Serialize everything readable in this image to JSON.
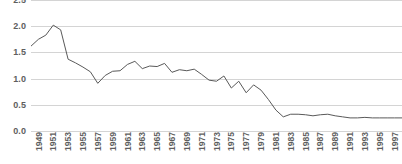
{
  "chart_data": {
    "type": "line",
    "title": "",
    "subtitle": "",
    "xlabel": "",
    "ylabel": "",
    "ylim": [
      0.0,
      2.5
    ],
    "ytick_labels": [
      "2.5",
      "2.0",
      "1.5",
      "1.0",
      "0.5",
      "0.0"
    ],
    "ytick_values": [
      2.5,
      2.0,
      1.5,
      1.0,
      0.5,
      0.0
    ],
    "grid": true,
    "grid_axis": "y",
    "legend": false,
    "legend_position": "none",
    "line_color": "#595959",
    "grid_color": "#d4d4d4",
    "text_color": "#5e5e5e",
    "background_color": "#ffffff",
    "xtick_labels": [
      "1949",
      "1951",
      "1953",
      "1955",
      "1957",
      "1959",
      "1961",
      "1963",
      "1965",
      "1967",
      "1969",
      "1971",
      "1973",
      "1975",
      "1977",
      "1979",
      "1981",
      "1983",
      "1985",
      "1987",
      "1989",
      "1991",
      "1993",
      "1995",
      "1997",
      "1999"
    ],
    "xtick_rotation": 90,
    "x": [
      1949,
      1950,
      1951,
      1952,
      1953,
      1954,
      1955,
      1956,
      1957,
      1958,
      1959,
      1960,
      1961,
      1962,
      1963,
      1964,
      1965,
      1966,
      1967,
      1968,
      1969,
      1970,
      1971,
      1972,
      1973,
      1974,
      1975,
      1976,
      1977,
      1978,
      1979,
      1980,
      1981,
      1982,
      1983,
      1984,
      1985,
      1986,
      1987,
      1988,
      1989,
      1990,
      1991,
      1992,
      1993,
      1994,
      1995,
      1996,
      1997,
      1998,
      1999
    ],
    "values": [
      1.62,
      1.75,
      1.83,
      2.02,
      1.93,
      1.37,
      1.3,
      1.22,
      1.13,
      0.91,
      1.06,
      1.14,
      1.15,
      1.27,
      1.33,
      1.19,
      1.24,
      1.23,
      1.29,
      1.12,
      1.17,
      1.15,
      1.18,
      1.08,
      0.97,
      0.95,
      1.05,
      0.82,
      0.95,
      0.73,
      0.88,
      0.78,
      0.6,
      0.4,
      0.27,
      0.32,
      0.32,
      0.31,
      0.29,
      0.31,
      0.32,
      0.29,
      0.27,
      0.25,
      0.25,
      0.26,
      0.25,
      0.25,
      0.25,
      0.25,
      0.25
    ]
  }
}
